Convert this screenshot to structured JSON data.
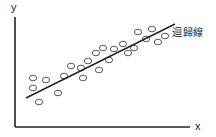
{
  "diagram": {
    "title": "",
    "x_axis_label": "x",
    "y_axis_label": "y",
    "regression_line_label": "迴歸線",
    "colors": {
      "axes": "#222222",
      "points_stroke": "#444444",
      "line": "#222222",
      "background": "#ffffff"
    }
  },
  "chart_data": {
    "type": "scatter",
    "title": "",
    "xlabel": "x",
    "ylabel": "y",
    "grid": false,
    "annotations": [
      "迴歸線"
    ],
    "points_pixel": [
      [
        33,
        78
      ],
      [
        33,
        88
      ],
      [
        46,
        80
      ],
      [
        39,
        102
      ],
      [
        58,
        93
      ],
      [
        64,
        76
      ],
      [
        71,
        66
      ],
      [
        83,
        78
      ],
      [
        81,
        68
      ],
      [
        88,
        61
      ],
      [
        96,
        53
      ],
      [
        99,
        70
      ],
      [
        103,
        48
      ],
      [
        109,
        60
      ],
      [
        114,
        49
      ],
      [
        123,
        44
      ],
      [
        128,
        53
      ],
      [
        134,
        48
      ],
      [
        138,
        32
      ],
      [
        146,
        39
      ],
      [
        152,
        29
      ],
      [
        158,
        42
      ],
      [
        165,
        36
      ]
    ],
    "regression_line_pixel": {
      "x1": 26,
      "y1": 98,
      "x2": 175,
      "y2": 24
    }
  }
}
